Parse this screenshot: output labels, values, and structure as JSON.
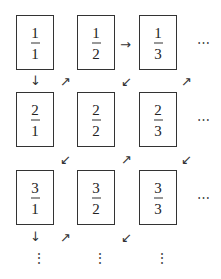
{
  "diagram": {
    "title": "",
    "grid": [
      [
        {
          "num": "1",
          "den": "1"
        },
        {
          "num": "1",
          "den": "2"
        },
        {
          "num": "1",
          "den": "3"
        }
      ],
      [
        {
          "num": "2",
          "den": "1"
        },
        {
          "num": "2",
          "den": "2"
        },
        {
          "num": "2",
          "den": "3"
        }
      ],
      [
        {
          "num": "3",
          "den": "1"
        },
        {
          "num": "3",
          "den": "2"
        },
        {
          "num": "3",
          "den": "3"
        }
      ]
    ],
    "arrows": {
      "down": "↓",
      "right": "→",
      "up_right": "↗",
      "down_left": "↙"
    },
    "ellipsis_h": "⋯",
    "ellipsis_v": "⋮"
  }
}
